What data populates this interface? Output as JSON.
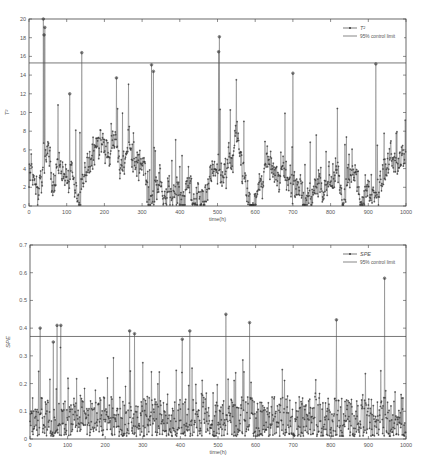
{
  "figure": {
    "caption": ""
  },
  "chart_data": [
    {
      "type": "line",
      "title": "",
      "xlabel": "time(h)",
      "ylabel": "T²",
      "xlim": [
        0,
        1000
      ],
      "ylim": [
        0,
        20
      ],
      "xticks": [
        0,
        100,
        200,
        300,
        400,
        500,
        600,
        700,
        800,
        900,
        1000
      ],
      "yticks": [
        0,
        2,
        4,
        6,
        8,
        10,
        12,
        14,
        16,
        18,
        20
      ],
      "grid": false,
      "legend_position": "upper right",
      "control_limit": 15.3,
      "series": [
        {
          "name": "T²",
          "style": "line with asterisk markers",
          "color": "#333333",
          "notable_peaks": [
            {
              "x": 38,
              "y": 20.0
            },
            {
              "x": 42,
              "y": 19.1
            },
            {
              "x": 40,
              "y": 18.3
            },
            {
              "x": 140,
              "y": 16.4
            },
            {
              "x": 325,
              "y": 15.1
            },
            {
              "x": 505,
              "y": 18.1
            },
            {
              "x": 503,
              "y": 16.5
            },
            {
              "x": 920,
              "y": 15.2
            },
            {
              "x": 330,
              "y": 14.4
            },
            {
              "x": 700,
              "y": 14.2
            },
            {
              "x": 108,
              "y": 12.0
            },
            {
              "x": 232,
              "y": 13.7
            }
          ],
          "baseline_range": [
            0,
            8
          ]
        },
        {
          "name": "95% control limit",
          "style": "solid line",
          "color": "#555555",
          "values_constant": 15.3
        }
      ]
    },
    {
      "type": "line",
      "title": "",
      "xlabel": "time(h)",
      "ylabel": "SPE",
      "xlim": [
        0,
        1000
      ],
      "ylim": [
        0,
        0.7
      ],
      "xticks": [
        0,
        100,
        200,
        300,
        400,
        500,
        600,
        700,
        800,
        900,
        1000
      ],
      "yticks": [
        0,
        0.1,
        0.2,
        0.3,
        0.4,
        0.5,
        0.6,
        0.7
      ],
      "grid": false,
      "legend_position": "upper right",
      "control_limit": 0.37,
      "series": [
        {
          "name": "SPE",
          "style": "line with asterisk markers",
          "color": "#333333",
          "notable_peaks": [
            {
              "x": 27,
              "y": 0.4
            },
            {
              "x": 62,
              "y": 0.35
            },
            {
              "x": 72,
              "y": 0.41
            },
            {
              "x": 82,
              "y": 0.41
            },
            {
              "x": 265,
              "y": 0.39
            },
            {
              "x": 278,
              "y": 0.38
            },
            {
              "x": 405,
              "y": 0.36
            },
            {
              "x": 425,
              "y": 0.39
            },
            {
              "x": 521,
              "y": 0.45
            },
            {
              "x": 584,
              "y": 0.42
            },
            {
              "x": 815,
              "y": 0.43
            },
            {
              "x": 943,
              "y": 0.58
            }
          ],
          "baseline_range": [
            0,
            0.2
          ]
        },
        {
          "name": "95% control limit",
          "style": "solid line",
          "color": "#555555",
          "values_constant": 0.37
        }
      ]
    }
  ]
}
